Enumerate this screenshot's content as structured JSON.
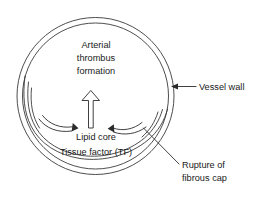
{
  "figure": {
    "type": "anatomical-cross-section-diagram",
    "background_color": "#ffffff",
    "line_color": "#2b2b2b"
  },
  "labels": {
    "center": {
      "name": "arterial-thrombus-formation",
      "line1": "Arterial",
      "line2": "thrombus",
      "line3": "formation"
    },
    "lipid_core": {
      "name": "lipid-core",
      "text": "Lipid core"
    },
    "tissue_factor": {
      "name": "tissue-factor",
      "text": "Tissue factor (TF)"
    },
    "vessel_wall": {
      "name": "vessel-wall",
      "text": "Vessel wall"
    },
    "rupture": {
      "name": "rupture-of-fibrous-cap",
      "line1": "Rupture of",
      "line2": "fibrous cap"
    }
  },
  "elements": {
    "vessel_wall_outer_circle": "outer vessel wall boundary",
    "vessel_wall_inner_circle": "inner vessel wall boundary",
    "plaque_lining": "fibrous cap / plaque inner lining arc",
    "flow_arrow_left": "curved flow arrow sweeping right",
    "flow_arrow_right": "curved flow arrow sweeping left",
    "thrombus_arrow": "hollow upward block arrow indicating thrombus growth",
    "vessel_wall_leader": "leader line with left arrowhead to vessel wall",
    "rupture_leader": "diagonal leader line to ruptured cap"
  }
}
